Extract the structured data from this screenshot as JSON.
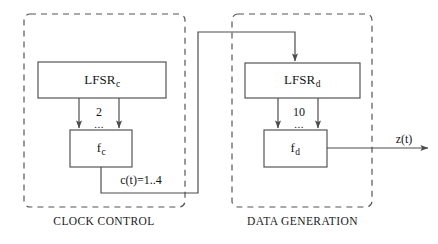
{
  "figure": {
    "background": "#ffffff",
    "line_color": "#4d4d4d",
    "text_color": "#141414"
  },
  "groups": [
    {
      "id": "clock-control",
      "label": "CLOCK CONTROL",
      "border_style": "dashed",
      "x": 24,
      "y": 14,
      "w": 161,
      "h": 193,
      "label_x": 104,
      "label_y": 222
    },
    {
      "id": "data-generation",
      "label": "DATA GENERATION",
      "border_style": "dashed",
      "x": 232,
      "y": 14,
      "w": 140,
      "h": 193,
      "label_x": 302,
      "label_y": 222
    }
  ],
  "blocks": [
    {
      "id": "lfsr-c",
      "label_main": "LFSR",
      "label_sub": "c",
      "x": 38,
      "y": 62,
      "w": 128,
      "h": 36,
      "cx": 102,
      "cy": 80
    },
    {
      "id": "f-c",
      "label_main": "f",
      "label_sub": "c",
      "x": 70,
      "y": 130,
      "w": 62,
      "h": 37,
      "cx": 101,
      "cy": 148
    },
    {
      "id": "lfsr-d",
      "label_main": "LFSR",
      "label_sub": "d",
      "x": 245,
      "y": 63,
      "w": 115,
      "h": 35,
      "cx": 302,
      "cy": 80
    },
    {
      "id": "f-d",
      "label_main": "f",
      "label_sub": "d",
      "x": 264,
      "y": 130,
      "w": 63,
      "h": 37,
      "cx": 295,
      "cy": 148
    }
  ],
  "wire_labels": [
    {
      "id": "tap-count-c",
      "text": "2",
      "x": 99,
      "y": 112
    },
    {
      "id": "tap-ellipsis-c",
      "text": "...",
      "x": 99,
      "y": 124
    },
    {
      "id": "tap-count-d",
      "text": "10",
      "x": 299,
      "y": 112
    },
    {
      "id": "tap-ellipsis-d",
      "text": "...",
      "x": 299,
      "y": 124
    },
    {
      "id": "clock-control-signal",
      "text": "c(t)=1..4",
      "x": 141,
      "y": 180
    },
    {
      "id": "output-signal",
      "text": "z(t)",
      "x": 404,
      "y": 139
    }
  ],
  "connections": [
    {
      "id": "lfsr-c-to-f-c-left",
      "from": "lfsr-c",
      "to": "f-c",
      "arrow": true
    },
    {
      "id": "lfsr-c-to-f-c-right",
      "from": "lfsr-c",
      "to": "f-c",
      "arrow": true
    },
    {
      "id": "f-c-to-lfsr-d",
      "from": "f-c",
      "to": "lfsr-d",
      "arrow": true,
      "label": "c(t)=1..4"
    },
    {
      "id": "lfsr-d-to-f-d-left",
      "from": "lfsr-d",
      "to": "f-d",
      "arrow": true
    },
    {
      "id": "lfsr-d-to-f-d-right",
      "from": "lfsr-d",
      "to": "f-d",
      "arrow": true
    },
    {
      "id": "f-d-to-output",
      "from": "f-d",
      "to": "output",
      "arrow": true,
      "label": "z(t)"
    }
  ]
}
